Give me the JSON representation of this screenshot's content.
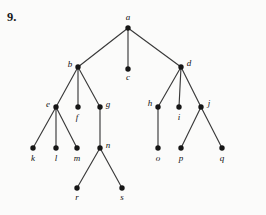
{
  "exercise": {
    "number": "9."
  },
  "diagram": {
    "type": "rooted-tree",
    "node_radius": 2.7,
    "colors": {
      "background": "#fbfbfa",
      "edge": "#3a3a3a",
      "node": "#161616",
      "label": "#111111"
    },
    "nodes": [
      {
        "id": "a",
        "label": "a",
        "x": 128,
        "y": 28,
        "label_x": 128,
        "label_y": 20,
        "anchor": "middle"
      },
      {
        "id": "b",
        "label": "b",
        "x": 78,
        "y": 67,
        "label_x": 70,
        "label_y": 67,
        "anchor": "middle"
      },
      {
        "id": "c",
        "label": "c",
        "x": 128,
        "y": 69,
        "label_x": 128,
        "label_y": 80,
        "anchor": "middle"
      },
      {
        "id": "d",
        "label": "d",
        "x": 181,
        "y": 67,
        "label_x": 189,
        "label_y": 66,
        "anchor": "middle"
      },
      {
        "id": "e",
        "label": "e",
        "x": 56,
        "y": 107,
        "label_x": 48,
        "label_y": 107,
        "anchor": "middle"
      },
      {
        "id": "f",
        "label": "f",
        "x": 78,
        "y": 107,
        "label_x": 77,
        "label_y": 120,
        "anchor": "middle"
      },
      {
        "id": "g",
        "label": "g",
        "x": 100,
        "y": 107,
        "label_x": 108,
        "label_y": 107,
        "anchor": "middle"
      },
      {
        "id": "h",
        "label": "h",
        "x": 158,
        "y": 107,
        "label_x": 150,
        "label_y": 106,
        "anchor": "middle"
      },
      {
        "id": "i",
        "label": "i",
        "x": 179,
        "y": 107,
        "label_x": 179,
        "label_y": 120,
        "anchor": "middle"
      },
      {
        "id": "j",
        "label": "j",
        "x": 201,
        "y": 107,
        "label_x": 209,
        "label_y": 106,
        "anchor": "middle"
      },
      {
        "id": "k",
        "label": "k",
        "x": 33,
        "y": 148,
        "label_x": 33,
        "label_y": 161,
        "anchor": "middle"
      },
      {
        "id": "l",
        "label": "l",
        "x": 56,
        "y": 148,
        "label_x": 56,
        "label_y": 161,
        "anchor": "middle"
      },
      {
        "id": "m",
        "label": "m",
        "x": 77,
        "y": 148,
        "label_x": 77,
        "label_y": 161,
        "anchor": "middle"
      },
      {
        "id": "n",
        "label": "n",
        "x": 100,
        "y": 148,
        "label_x": 108,
        "label_y": 148,
        "anchor": "middle"
      },
      {
        "id": "o",
        "label": "o",
        "x": 158,
        "y": 148,
        "label_x": 158,
        "label_y": 161,
        "anchor": "middle"
      },
      {
        "id": "p",
        "label": "p",
        "x": 181,
        "y": 148,
        "label_x": 181,
        "label_y": 161,
        "anchor": "middle"
      },
      {
        "id": "q",
        "label": "q",
        "x": 222,
        "y": 148,
        "label_x": 222,
        "label_y": 161,
        "anchor": "middle"
      },
      {
        "id": "r",
        "label": "r",
        "x": 77,
        "y": 188,
        "label_x": 77,
        "label_y": 200,
        "anchor": "middle"
      },
      {
        "id": "s",
        "label": "s",
        "x": 122,
        "y": 188,
        "label_x": 122,
        "label_y": 200,
        "anchor": "middle"
      }
    ],
    "edges": [
      {
        "from": "a",
        "to": "b"
      },
      {
        "from": "a",
        "to": "c"
      },
      {
        "from": "a",
        "to": "d"
      },
      {
        "from": "b",
        "to": "e"
      },
      {
        "from": "b",
        "to": "f"
      },
      {
        "from": "b",
        "to": "g"
      },
      {
        "from": "d",
        "to": "h"
      },
      {
        "from": "d",
        "to": "i"
      },
      {
        "from": "d",
        "to": "j"
      },
      {
        "from": "e",
        "to": "k"
      },
      {
        "from": "e",
        "to": "l"
      },
      {
        "from": "e",
        "to": "m"
      },
      {
        "from": "g",
        "to": "n"
      },
      {
        "from": "h",
        "to": "o"
      },
      {
        "from": "j",
        "to": "p"
      },
      {
        "from": "j",
        "to": "q"
      },
      {
        "from": "n",
        "to": "r"
      },
      {
        "from": "n",
        "to": "s"
      }
    ]
  }
}
